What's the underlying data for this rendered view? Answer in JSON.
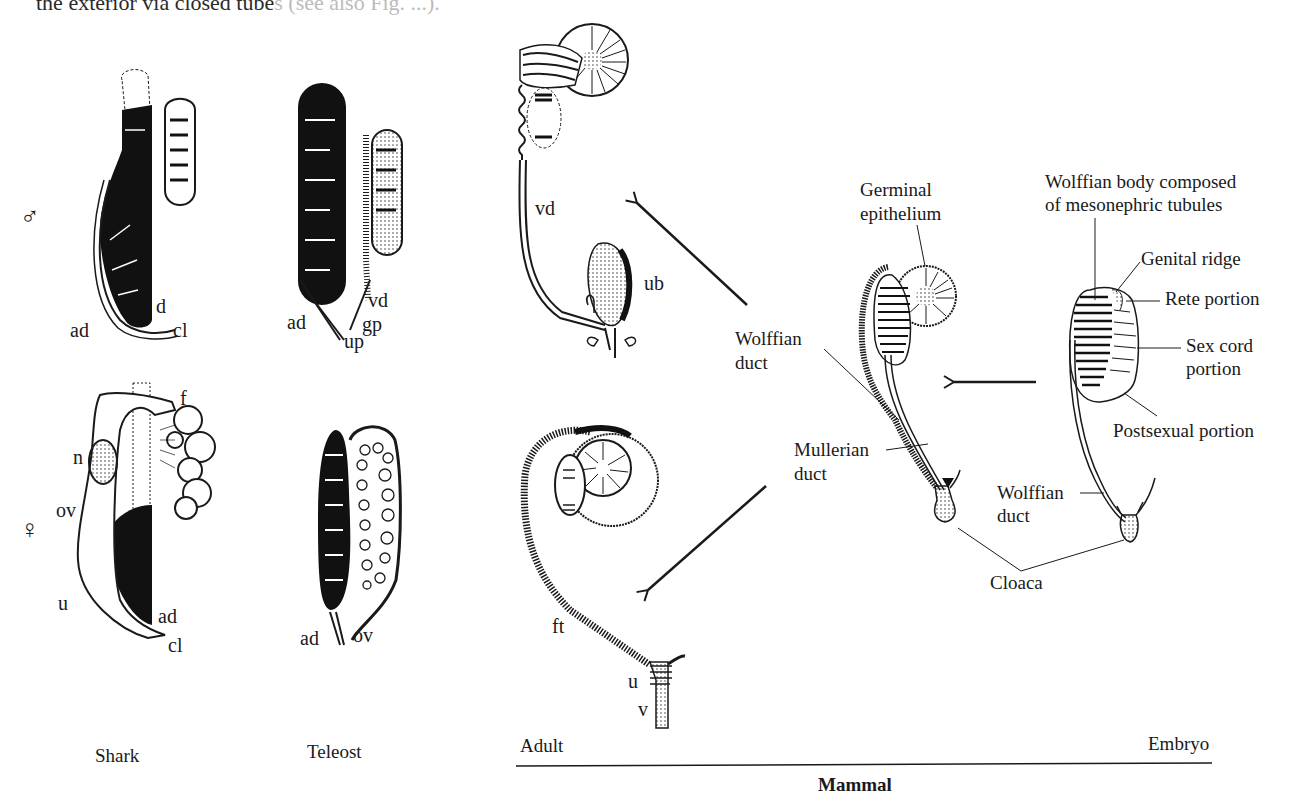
{
  "caption_fragment": {
    "text": "the exterior via closed tube",
    "faded_text": "s (see also Fig. ...)."
  },
  "sex_symbols": {
    "male": "♂",
    "female": "♀"
  },
  "columns": {
    "shark": "Shark",
    "teleost": "Teleost",
    "adult": "Adult",
    "embryo": "Embryo",
    "mammal": "Mammal"
  },
  "shark_male_labels": {
    "d": "d",
    "ad": "ad",
    "cl": "cl"
  },
  "teleost_male_labels": {
    "vd": "vd",
    "ad": "ad",
    "gp": "gp",
    "up": "up"
  },
  "shark_female_labels": {
    "f": "f",
    "n": "n",
    "ov": "ov",
    "u": "u",
    "ad": "ad",
    "cl": "cl"
  },
  "teleost_female_labels": {
    "ad": "ad",
    "ov": "ov"
  },
  "mammal_adult_male_labels": {
    "vd": "vd",
    "ub": "ub"
  },
  "mammal_adult_female_labels": {
    "ft": "ft",
    "u": "u",
    "v": "v"
  },
  "mammal_middle_labels": {
    "germinal_1": "Germinal",
    "germinal_2": "epithelium",
    "wolffian_duct_1": "Wolffian",
    "wolffian_duct_2": "duct",
    "mullerian_duct_1": "Mullerian",
    "mullerian_duct_2": "duct",
    "cloaca": "Cloaca"
  },
  "mammal_embryo_labels": {
    "wolffian_body_1": "Wolffian body composed",
    "wolffian_body_2": "of mesonephric tubules",
    "genital_ridge": "Genital ridge",
    "rete_portion": "Rete portion",
    "sex_cord_1": "Sex cord",
    "sex_cord_2": "portion",
    "postsexual": "Postsexual portion",
    "wolffian_duct_1": "Wolffian",
    "wolffian_duct_2": "duct"
  },
  "colors": {
    "ink": "#1a1a1a",
    "paper": "#ffffff",
    "faded": "#bcbcbc"
  }
}
